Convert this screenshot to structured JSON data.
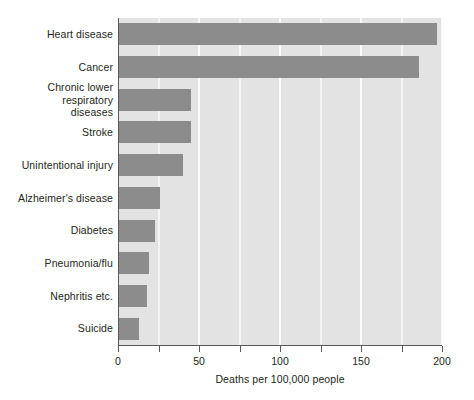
{
  "chart_data": {
    "type": "bar",
    "orientation": "horizontal",
    "title": "",
    "xlabel": "Deaths per 100,000 people",
    "ylabel": "",
    "xlim": [
      0,
      200
    ],
    "xticks": [
      0,
      25,
      50,
      75,
      100,
      125,
      150,
      175,
      200
    ],
    "xtick_labels": [
      "0",
      "",
      "50",
      "",
      "100",
      "",
      "150",
      "",
      "200"
    ],
    "grid": true,
    "grid_axis": "x",
    "legend": null,
    "categories": [
      "Heart disease",
      "Cancer",
      "Chronic lower respiratory diseases",
      "Stroke",
      "Unintentional injury",
      "Alzheimer's disease",
      "Diabetes",
      "Pneumonia/flu",
      "Nephritis etc.",
      "Suicide"
    ],
    "category_label_lines": [
      [
        "Heart disease"
      ],
      [
        "Cancer"
      ],
      [
        "Chronic lower",
        "respiratory",
        "diseases"
      ],
      [
        "Stroke"
      ],
      [
        "Unintentional injury"
      ],
      [
        "Alzheimer's disease"
      ],
      [
        "Diabetes"
      ],
      [
        "Pneumonia/flu"
      ],
      [
        "Nephritis etc."
      ],
      [
        "Suicide"
      ]
    ],
    "values": [
      197,
      186,
      45,
      45,
      40,
      26,
      23,
      19,
      18,
      13
    ],
    "bar_color": "#8c8c8c",
    "plot_background": "#e3e3e3",
    "gridline_color": "#fafafa"
  }
}
